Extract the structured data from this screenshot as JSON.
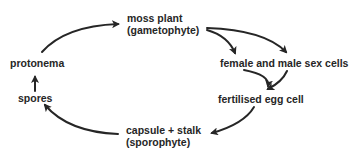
{
  "diagram": {
    "type": "life-cycle",
    "nodes": {
      "moss_plant": {
        "line1": "moss plant",
        "line2": "(gametophyte)"
      },
      "sex_cells": {
        "label": "female and male sex cells"
      },
      "egg": {
        "label": "fertilised egg cell"
      },
      "capsule": {
        "line1": "capsule + stalk",
        "line2": "(sporophyte)"
      },
      "spores": {
        "label": "spores"
      },
      "protonema": {
        "label": "protonema"
      }
    },
    "edges": [
      {
        "from": "moss plant (gametophyte)",
        "to": "female and male sex cells",
        "count": 2
      },
      {
        "from": "female and male sex cells",
        "to": "fertilised egg cell",
        "count": 2
      },
      {
        "from": "fertilised egg cell",
        "to": "capsule + stalk (sporophyte)"
      },
      {
        "from": "capsule + stalk (sporophyte)",
        "to": "spores"
      },
      {
        "from": "spores",
        "to": "protonema"
      },
      {
        "from": "protonema",
        "to": "moss plant (gametophyte)"
      }
    ],
    "colors": {
      "arrow": "#262626",
      "text": "#262626",
      "background": "#ffffff"
    }
  }
}
